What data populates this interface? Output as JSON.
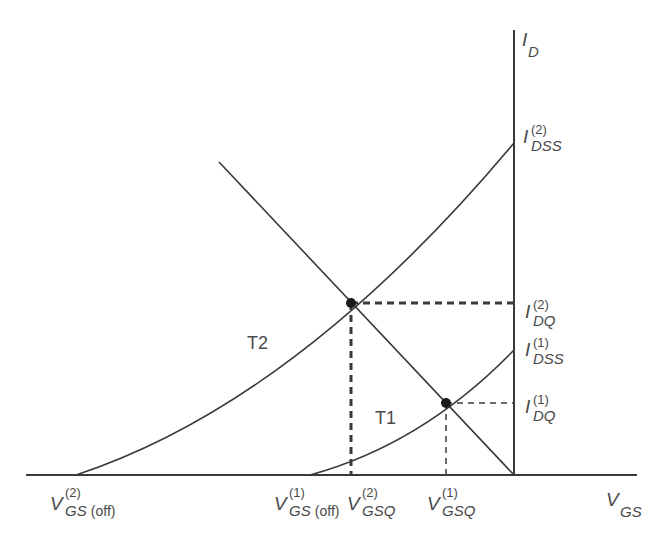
{
  "diagram": {
    "colors": {
      "line": "#3a3a3a",
      "text": "#4a4a4a",
      "background": "#ffffff"
    },
    "axes": {
      "y_label": {
        "main": "I",
        "sub": "D"
      },
      "x_label": {
        "main": "V",
        "sub": "GS"
      }
    },
    "curves": [
      {
        "name": "T2",
        "label": "T2"
      },
      {
        "name": "T1",
        "label": "T1"
      }
    ],
    "labels": {
      "idss2": {
        "main": "I",
        "sup": "(2)",
        "sub": "DSS"
      },
      "idq2": {
        "main": "I",
        "sup": "(2)",
        "sub": "DQ"
      },
      "idss1": {
        "main": "I",
        "sup": "(1)",
        "sub": "DSS"
      },
      "idq1": {
        "main": "I",
        "sup": "(1)",
        "sub": "DQ"
      },
      "vgsoff2": {
        "main": "V",
        "sup": "(2)",
        "sub": "GS",
        "sub_plain": "(off)"
      },
      "vgsoff1": {
        "main": "V",
        "sup": "(1)",
        "sub": "GS",
        "sub_plain": "(off)"
      },
      "vgsq2": {
        "main": "V",
        "sup": "(2)",
        "sub": "GSQ"
      },
      "vgsq1": {
        "main": "V",
        "sup": "(1)",
        "sub": "GSQ"
      }
    },
    "operating_points": [
      {
        "name": "Q2",
        "curve": "T2"
      },
      {
        "name": "Q1",
        "curve": "T1"
      }
    ]
  }
}
